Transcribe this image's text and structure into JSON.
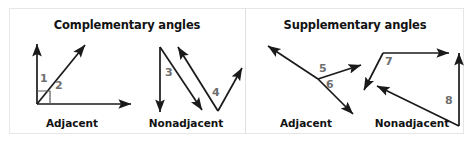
{
  "figure": {
    "background_color": "#ffffff",
    "card_border_color": "#e6e6e6",
    "divider_color": "#e0e0e0",
    "stroke_color": "#1a1a1a",
    "label_color": "#6e6e6e",
    "text_color": "#121212"
  },
  "panels": [
    {
      "id": "complementary",
      "title": "Complementary angles",
      "diagrams": [
        {
          "id": "complementary-adjacent",
          "caption": "Adjacent",
          "angle_labels": [
            "1",
            "2"
          ],
          "right_angle_marker": true
        },
        {
          "id": "complementary-nonadjacent",
          "caption": "Nonadjacent",
          "angle_labels": [
            "3",
            "4"
          ],
          "right_angle_marker": false
        }
      ]
    },
    {
      "id": "supplementary",
      "title": "Supplementary angles",
      "diagrams": [
        {
          "id": "supplementary-adjacent",
          "caption": "Adjacent",
          "angle_labels": [
            "5",
            "6"
          ],
          "right_angle_marker": false
        },
        {
          "id": "supplementary-nonadjacent",
          "caption": "Nonadjacent",
          "angle_labels": [
            "7",
            "8"
          ],
          "right_angle_marker": false
        }
      ]
    }
  ]
}
